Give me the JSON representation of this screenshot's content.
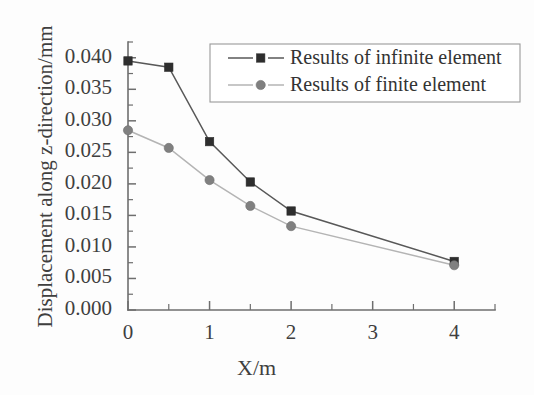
{
  "chart_data": {
    "type": "line",
    "title": "",
    "xlabel": "X/m",
    "ylabel": "Displacement along z-direction/mm",
    "xlim": [
      0,
      4.5
    ],
    "ylim": [
      0.0,
      0.0425
    ],
    "grid": false,
    "legend_position": "top-right",
    "x": [
      0,
      0.5,
      1,
      1.5,
      2,
      4
    ],
    "xticks": [
      0,
      1,
      2,
      3,
      4
    ],
    "xtick_labels": [
      "0",
      "1",
      "2",
      "3",
      "4"
    ],
    "xminor_ticks": [
      0.5,
      1.5,
      2.5,
      3.5,
      4.5
    ],
    "yticks": [
      0.0,
      0.005,
      0.01,
      0.015,
      0.02,
      0.025,
      0.03,
      0.035,
      0.04
    ],
    "ytick_labels": [
      "0.000",
      "0.005",
      "0.010",
      "0.015",
      "0.020",
      "0.025",
      "0.030",
      "0.035",
      "0.040"
    ],
    "series": [
      {
        "name": "Results of infinite element",
        "marker": "square",
        "color": "#2e2e2e",
        "line_color": "#585858",
        "values": [
          0.0395,
          0.0385,
          0.0267,
          0.0203,
          0.0157,
          0.0077
        ]
      },
      {
        "name": "Results of finite element",
        "marker": "circle",
        "color": "#808080",
        "line_color": "#b4b4b4",
        "values": [
          0.0285,
          0.0257,
          0.0206,
          0.0165,
          0.0133,
          0.0071
        ]
      }
    ]
  },
  "legend": {
    "items": [
      {
        "label": "Results of infinite element"
      },
      {
        "label": "Results of finite element"
      }
    ]
  },
  "axes": {
    "x_title": "X/m",
    "y_title": "Displacement along z-direction/mm"
  }
}
